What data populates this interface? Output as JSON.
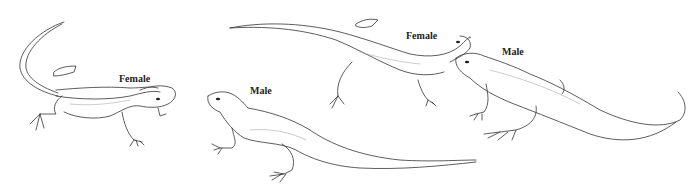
{
  "figure": {
    "background": "#ffffff",
    "line_color": "#333333",
    "labels": [
      {
        "id": "female-left",
        "text": "Female",
        "x": 119,
        "y": 73
      },
      {
        "id": "male-center",
        "text": "Male",
        "x": 250,
        "y": 85
      },
      {
        "id": "female-right",
        "text": "Female",
        "x": 406,
        "y": 30
      },
      {
        "id": "male-right",
        "text": "Male",
        "x": 502,
        "y": 46
      }
    ]
  }
}
